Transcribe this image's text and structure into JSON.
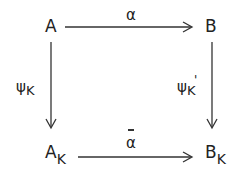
{
  "diagram": {
    "type": "commutative-square",
    "nodes": {
      "top_left": {
        "main": "A",
        "sub": ""
      },
      "top_right": {
        "main": "B",
        "sub": ""
      },
      "bottom_left": {
        "main": "A",
        "sub": "K"
      },
      "bottom_right": {
        "main": "B",
        "sub": "K"
      }
    },
    "arrows": {
      "top": {
        "label": "α",
        "from": "A",
        "to": "B"
      },
      "bottom": {
        "label": "α",
        "overline": true,
        "from": "A_K",
        "to": "B_K"
      },
      "left": {
        "label_main": "ψ",
        "label_sub": "K",
        "from": "A",
        "to": "A_K"
      },
      "right": {
        "label_main": "ψ",
        "label_sub": "K",
        "prime": "'",
        "from": "B",
        "to": "B_K"
      }
    }
  }
}
